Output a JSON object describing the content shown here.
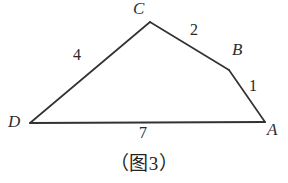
{
  "figure": {
    "caption": "（图 3）",
    "caption_paren_open": "（",
    "caption_word": "图",
    "caption_number": "3",
    "caption_paren_close": "）",
    "stroke_color": "#333333",
    "background_color": "#ffffff",
    "text_color": "#2b2b2b",
    "shape_type": "quadrilateral",
    "vertices": [
      {
        "name": "D",
        "label": "D",
        "x": 30,
        "y": 123,
        "label_x": 8,
        "label_y": 114
      },
      {
        "name": "C",
        "label": "C",
        "x": 150,
        "y": 22,
        "label_x": 133,
        "label_y": 1
      },
      {
        "name": "B",
        "label": "B",
        "x": 229,
        "y": 70,
        "label_x": 232,
        "label_y": 42
      },
      {
        "name": "A",
        "label": "A",
        "x": 265,
        "y": 122,
        "label_x": 267,
        "label_y": 122
      }
    ],
    "edges": [
      {
        "name": "DC",
        "from": "D",
        "to": "C",
        "length_label": "4",
        "label_x": 73,
        "label_y": 48
      },
      {
        "name": "CB",
        "from": "C",
        "to": "B",
        "length_label": "2",
        "label_x": 190,
        "label_y": 23
      },
      {
        "name": "BA",
        "from": "B",
        "to": "A",
        "length_label": "1",
        "label_x": 249,
        "label_y": 79
      },
      {
        "name": "DA",
        "from": "D",
        "to": "A",
        "length_label": "7",
        "label_x": 139,
        "label_y": 126
      }
    ]
  }
}
